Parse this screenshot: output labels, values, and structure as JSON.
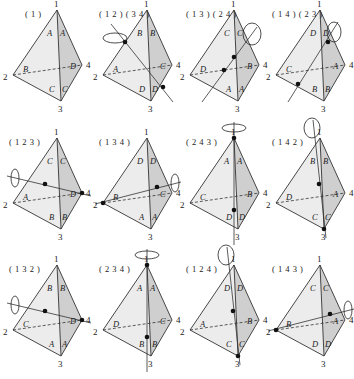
{
  "figure": {
    "fill_left": "#ececec",
    "fill_right": "#cfcfcf",
    "edge_color": "#333333"
  },
  "tetrahedra": [
    {
      "label": "( 1 )",
      "x": 5,
      "y": 2,
      "axis": "none",
      "faces": {
        "top_left": "A",
        "top_right": "A",
        "mid_left": "B",
        "mid_right": "D",
        "bot_left": "C",
        "bot_right": "C"
      }
    },
    {
      "label": "( 1 2 ) ( 3 4 )",
      "x": 95,
      "y": 2,
      "axis": "edge-edge",
      "faces": {
        "top_left": "B",
        "top_right": "B",
        "mid_left": "A",
        "mid_right": "C",
        "bot_left": "D",
        "bot_right": "D"
      }
    },
    {
      "label": "( 1 3 ) ( 2 4 )",
      "x": 182,
      "y": 2,
      "axis": "edge-edge",
      "faces": {
        "top_left": "C",
        "top_right": "C",
        "mid_left": "D",
        "mid_right": "B",
        "bot_left": "A",
        "bot_right": "A"
      }
    },
    {
      "label": "( 1 4 ) ( 2 3 )",
      "x": 268,
      "y": 2,
      "axis": "edge-edge",
      "faces": {
        "top_left": "D",
        "top_right": "D",
        "mid_left": "C",
        "mid_right": "A",
        "bot_left": "B",
        "bot_right": "B"
      }
    },
    {
      "label": "( 1 2 3 )",
      "x": 5,
      "y": 130,
      "axis": "vertex4",
      "faces": {
        "top_left": "C",
        "top_right": "C",
        "mid_left": "A",
        "mid_right": "D",
        "bot_left": "B",
        "bot_right": "B"
      }
    },
    {
      "label": "( 1 3 4 )",
      "x": 95,
      "y": 130,
      "axis": "vertex2",
      "faces": {
        "top_left": "D",
        "top_right": "D",
        "mid_left": "B",
        "mid_right": "C",
        "bot_left": "A",
        "bot_right": "A"
      }
    },
    {
      "label": "( 2 4 3 )",
      "x": 182,
      "y": 130,
      "axis": "vertex1",
      "faces": {
        "top_left": "A",
        "top_right": "A",
        "mid_left": "C",
        "mid_right": "B",
        "bot_left": "D",
        "bot_right": "D"
      }
    },
    {
      "label": "( 1 4 2 )",
      "x": 268,
      "y": 130,
      "axis": "vertex3",
      "faces": {
        "top_left": "B",
        "top_right": "B",
        "mid_left": "D",
        "mid_right": "A",
        "bot_left": "C",
        "bot_right": "C"
      }
    },
    {
      "label": "( 1 3 2 )",
      "x": 5,
      "y": 257,
      "axis": "vertex4",
      "faces": {
        "top_left": "B",
        "top_right": "B",
        "mid_left": "C",
        "mid_right": "D",
        "bot_left": "A",
        "bot_right": "A"
      }
    },
    {
      "label": "( 2 3 4 )",
      "x": 95,
      "y": 257,
      "axis": "vertex1",
      "faces": {
        "top_left": "A",
        "top_right": "A",
        "mid_left": "D",
        "mid_right": "C",
        "bot_left": "B",
        "bot_right": "B"
      }
    },
    {
      "label": "( 1 2 4 )",
      "x": 182,
      "y": 257,
      "axis": "vertex3",
      "faces": {
        "top_left": "D",
        "top_right": "D",
        "mid_left": "A",
        "mid_right": "B",
        "bot_left": "C",
        "bot_right": "C"
      }
    },
    {
      "label": "( 1 4 3 )",
      "x": 268,
      "y": 257,
      "axis": "vertex2",
      "faces": {
        "top_left": "C",
        "top_right": "C",
        "mid_left": "B",
        "mid_right": "A",
        "bot_left": "D",
        "bot_right": "D"
      }
    }
  ],
  "vertex_labels": {
    "v1": "1",
    "v2": "2",
    "v3": "3",
    "v4": "4"
  }
}
